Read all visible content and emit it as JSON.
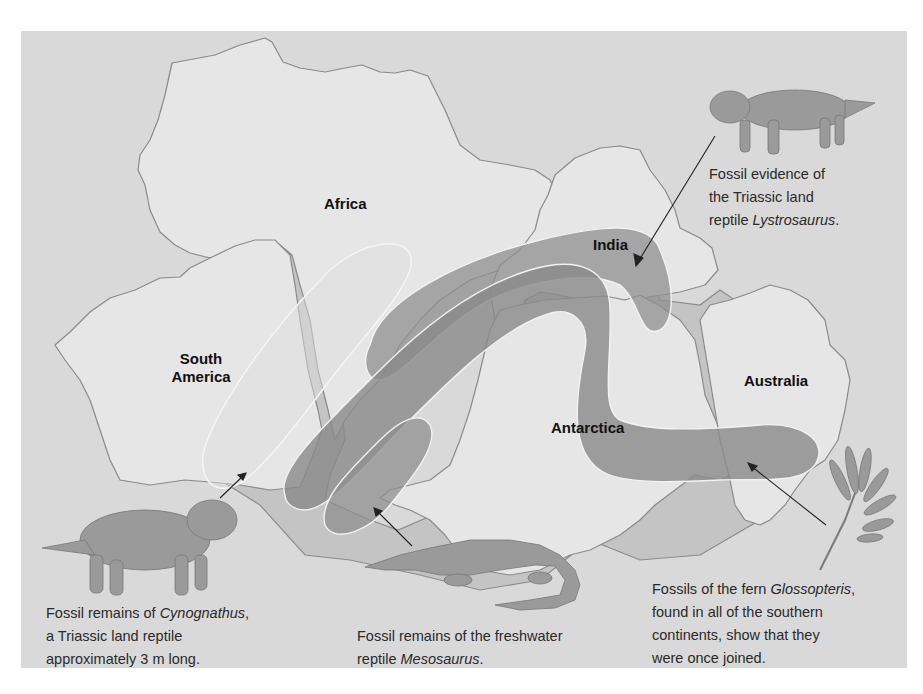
{
  "figure": {
    "colors": {
      "page_background": "#ffffff",
      "panel_background": "#d9d9d9",
      "continent_fill": "#e6e6e6",
      "continent_outline": "#8a8a8a",
      "shelf_fill": "#bdbdbd",
      "band_fill": "#8f8f8f",
      "band_outline": "#f2f2f2",
      "animal_fill": "#9a9a9a",
      "text": "#2a2a2a"
    },
    "continents": [
      {
        "id": "africa",
        "label": "Africa"
      },
      {
        "id": "south-america",
        "label": "South America",
        "label_lines": [
          "South",
          "America"
        ]
      },
      {
        "id": "india",
        "label": "India"
      },
      {
        "id": "antarctica",
        "label": "Antarctica"
      },
      {
        "id": "australia",
        "label": "Australia"
      }
    ],
    "fossil_zones": [
      {
        "id": "cynognathus-zone",
        "style": "outline-only",
        "description": "Cynognathus range across South America and Africa"
      },
      {
        "id": "lystrosaurus-zone",
        "style": "shaded",
        "description": "Lystrosaurus range across Africa, India and Antarctica"
      },
      {
        "id": "glossopteris-zone",
        "style": "shaded",
        "description": "Glossopteris range across all southern continents"
      },
      {
        "id": "mesosaurus-zone",
        "style": "shaded",
        "description": "Mesosaurus range in southern South America and Africa"
      }
    ],
    "captions": {
      "lystrosaurus": {
        "lines": [
          "Fossil evidence of",
          "the Triassic land",
          "reptile "
        ],
        "italic": "Lystrosaurus",
        "suffix": "."
      },
      "cynognathus": {
        "line1_prefix": "Fossil remains of ",
        "line1_italic": "Cynognathus",
        "line1_suffix": ",",
        "line2": "a Triassic land reptile",
        "line3": "approximately 3 m long."
      },
      "mesosaurus": {
        "line1": "Fossil remains of the freshwater",
        "line2_prefix": "reptile ",
        "line2_italic": "Mesosaurus",
        "line2_suffix": "."
      },
      "glossopteris": {
        "line1_prefix": "Fossils of the fern ",
        "line1_italic": "Glossopteris",
        "line1_suffix": ",",
        "line2": "found in all of the southern",
        "line3": "continents, show that they",
        "line4": "were once joined."
      }
    },
    "illustrations": [
      {
        "id": "lystrosaurus-illustration",
        "icon": "reptile-icon"
      },
      {
        "id": "cynognathus-illustration",
        "icon": "reptile-icon"
      },
      {
        "id": "mesosaurus-illustration",
        "icon": "aquatic-reptile-icon"
      },
      {
        "id": "glossopteris-illustration",
        "icon": "fern-icon"
      }
    ]
  }
}
